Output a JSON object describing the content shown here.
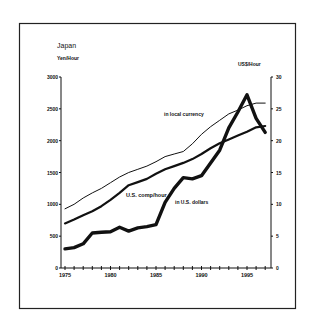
{
  "chart_data": {
    "type": "line",
    "title": "Japan",
    "ylabel": "Yen/Hour",
    "ylabel_right": "US$/Hour",
    "xlabel": "",
    "x": [
      1975,
      1976,
      1977,
      1978,
      1979,
      1980,
      1981,
      1982,
      1983,
      1984,
      1985,
      1986,
      1987,
      1988,
      1989,
      1990,
      1991,
      1992,
      1993,
      1994,
      1995,
      1996,
      1997
    ],
    "xticks": [
      1975,
      1980,
      1985,
      1990,
      1995
    ],
    "ylim": [
      0,
      3000
    ],
    "yticks": [
      0,
      500,
      1000,
      1500,
      2000,
      2500,
      3000
    ],
    "ylim_right": [
      0,
      30
    ],
    "yticks_right": [
      0,
      5,
      10,
      15,
      20,
      25,
      30
    ],
    "grid": false,
    "series": [
      {
        "name": "in local currency",
        "axis": "left",
        "style": "thin",
        "values": [
          930,
          1000,
          1100,
          1180,
          1250,
          1340,
          1430,
          1500,
          1550,
          1600,
          1670,
          1750,
          1790,
          1830,
          1950,
          2100,
          2220,
          2320,
          2420,
          2480,
          2550,
          2590,
          2590
        ]
      },
      {
        "name": "U.S. comp/hour",
        "axis": "left",
        "style": "medium",
        "values": [
          700,
          760,
          830,
          890,
          970,
          1070,
          1180,
          1300,
          1350,
          1400,
          1480,
          1550,
          1600,
          1650,
          1710,
          1790,
          1880,
          1960,
          2020,
          2080,
          2140,
          2210,
          2230
        ]
      },
      {
        "name": "in U.S. dollars",
        "axis": "right",
        "style": "thick",
        "values": [
          3.0,
          3.2,
          3.8,
          5.5,
          5.6,
          5.7,
          6.4,
          5.8,
          6.3,
          6.5,
          6.8,
          10.3,
          12.5,
          14.2,
          14.0,
          14.5,
          16.5,
          18.5,
          22.0,
          24.5,
          27.2,
          23.5,
          21.3
        ]
      }
    ],
    "annotations": [
      {
        "text": "in local currency",
        "x": 1988,
        "y": 2500
      },
      {
        "text": "U.S. comp/hour",
        "x": 1982,
        "y": 1150
      },
      {
        "text": "in U.S. dollars",
        "x": 1988,
        "y": 1000
      }
    ]
  },
  "labels": {
    "title": "Japan",
    "left_unit": "Yen/Hour",
    "right_unit": "US$/Hour",
    "series_local": "in local currency",
    "series_comp": "U.S. comp/hour",
    "series_usd": "in U.S. dollars"
  }
}
